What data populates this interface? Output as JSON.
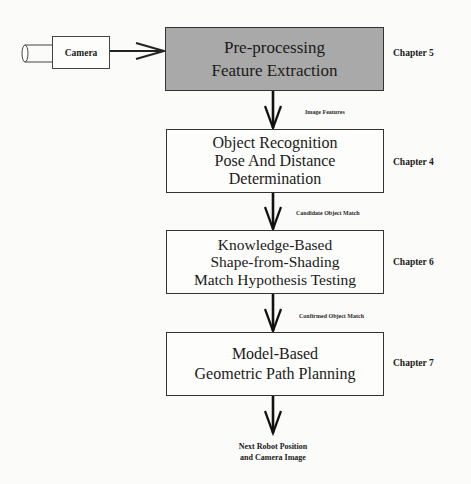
{
  "diagram": {
    "type": "flowchart",
    "source": {
      "label": "Camera",
      "icon": "camera-icon"
    },
    "stages": [
      {
        "id": "preprocessing",
        "lines": [
          "Pre-processing",
          "Feature Extraction"
        ],
        "chapter": "Chapter 5",
        "shaded": true,
        "fill_color": "#a9a9a9"
      },
      {
        "id": "object-recognition",
        "lines": [
          "Object Recognition",
          "Pose And Distance",
          "Determination"
        ],
        "chapter": "Chapter 4",
        "shaded": false
      },
      {
        "id": "shape-from-shading",
        "lines": [
          "Knowledge-Based",
          "Shape-from-Shading",
          "Match Hypothesis Testing"
        ],
        "chapter": "Chapter 6",
        "shaded": false
      },
      {
        "id": "path-planning",
        "lines": [
          "Model-Based",
          "Geometric Path Planning"
        ],
        "chapter": "Chapter 7",
        "shaded": false
      }
    ],
    "edges": [
      {
        "from": "camera",
        "to": "preprocessing",
        "label": ""
      },
      {
        "from": "preprocessing",
        "to": "object-recognition",
        "label": "Image Features"
      },
      {
        "from": "object-recognition",
        "to": "shape-from-shading",
        "label": "Candidate Object Match"
      },
      {
        "from": "shape-from-shading",
        "to": "path-planning",
        "label": "Confirmed Object Match"
      },
      {
        "from": "path-planning",
        "to": "output",
        "label": ""
      }
    ],
    "output": {
      "lines": [
        "Next Robot Position",
        "and Camera Image"
      ]
    }
  }
}
